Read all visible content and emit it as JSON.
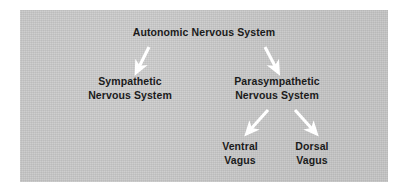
{
  "figure": {
    "title_text": "Autonomic Nervous System",
    "background_color": "#ffffff",
    "panel_color": "#c8c8c8",
    "text_color": "#1b1b1b",
    "arrow_color": "#ffffff"
  },
  "nodes": {
    "root": {
      "label": "Autonomic Nervous System"
    },
    "sympathetic": {
      "line1": "Sympathetic",
      "line2": "Nervous System"
    },
    "parasympathetic": {
      "line1": "Parasympathetic",
      "line2": "Nervous System"
    },
    "ventral_vagus": {
      "line1": "Ventral",
      "line2": "Vagus"
    },
    "dorsal_vagus": {
      "line1": "Dorsal",
      "line2": "Vagus"
    }
  },
  "connectors": [
    {
      "name": "root-to-sympathetic",
      "direction": "down-left"
    },
    {
      "name": "root-to-parasympathetic",
      "direction": "down-right"
    },
    {
      "name": "parasympathetic-to-ventral-vagus",
      "direction": "down-left"
    },
    {
      "name": "parasympathetic-to-dorsal-vagus",
      "direction": "down-right"
    }
  ]
}
